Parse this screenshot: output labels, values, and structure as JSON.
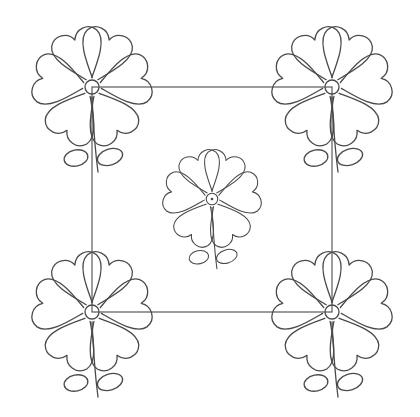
{
  "canvas": {
    "width": 420,
    "height": 417,
    "background": "#ffffff",
    "stroke": "#4a4a4a"
  },
  "pattern": {
    "type": "quilting block line art",
    "frame": {
      "x1": 92,
      "y1": 87,
      "x2": 332,
      "y2": 312
    },
    "flowers": [
      {
        "id": "top-left",
        "cx": 92,
        "cy": 87,
        "petals": 6
      },
      {
        "id": "top-right",
        "cx": 332,
        "cy": 87,
        "petals": 6
      },
      {
        "id": "center",
        "cx": 212,
        "cy": 199,
        "petals": 6,
        "scale": 0.8
      },
      {
        "id": "bottom-left",
        "cx": 92,
        "cy": 312,
        "petals": 6
      },
      {
        "id": "bottom-right",
        "cx": 332,
        "cy": 312,
        "petals": 6
      }
    ]
  }
}
